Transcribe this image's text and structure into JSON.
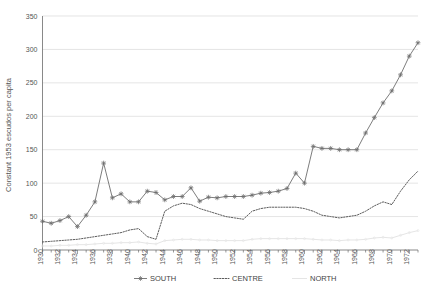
{
  "chart_data": {
    "type": "line",
    "title": "",
    "xlabel": "",
    "ylabel": "Constant 1953 escudos per capita",
    "xlim": [
      1930,
      1973
    ],
    "ylim": [
      0,
      350
    ],
    "ytick_step": 50,
    "xtick_step": 2,
    "grid": true,
    "legend_position": "bottom",
    "ytick_labels": [
      "0",
      "50",
      "100",
      "150",
      "200",
      "250",
      "300",
      "350"
    ],
    "yticks": [
      0,
      50,
      100,
      150,
      200,
      250,
      300,
      350
    ],
    "xtick_labels": [
      "1930",
      "1932",
      "1934",
      "1936",
      "1938",
      "1940",
      "1942",
      "1944",
      "1946",
      "1948",
      "1950",
      "1952",
      "1954",
      "1956",
      "1958",
      "1960",
      "1962",
      "1964",
      "1966",
      "1968",
      "1970",
      "1972"
    ],
    "xticks": [
      1930,
      1932,
      1934,
      1936,
      1938,
      1940,
      1942,
      1944,
      1946,
      1948,
      1950,
      1952,
      1954,
      1956,
      1958,
      1960,
      1962,
      1964,
      1966,
      1968,
      1970,
      1972
    ],
    "x": [
      1930,
      1931,
      1932,
      1933,
      1934,
      1935,
      1936,
      1937,
      1938,
      1939,
      1940,
      1941,
      1942,
      1943,
      1944,
      1945,
      1946,
      1947,
      1948,
      1949,
      1950,
      1951,
      1952,
      1953,
      1954,
      1955,
      1956,
      1957,
      1958,
      1959,
      1960,
      1961,
      1962,
      1963,
      1964,
      1965,
      1966,
      1967,
      1968,
      1969,
      1970,
      1971,
      1972,
      1973
    ],
    "series": [
      {
        "name": "SOUTH",
        "marker": "star",
        "linestyle": "solid",
        "color": "#6e6e6e",
        "values": [
          43,
          40,
          44,
          50,
          35,
          52,
          72,
          130,
          78,
          84,
          72,
          72,
          88,
          86,
          75,
          80,
          80,
          93,
          73,
          79,
          78,
          80,
          80,
          80,
          82,
          85,
          86,
          88,
          92,
          115,
          100,
          155,
          152,
          152,
          150,
          150,
          150,
          175,
          198,
          220,
          238,
          262,
          290,
          310
        ]
      },
      {
        "name": "CENTRE",
        "marker": "none",
        "linestyle": "dotted",
        "color": "#4a4a4a",
        "values": [
          12,
          13,
          14,
          15,
          16,
          18,
          20,
          22,
          24,
          26,
          30,
          32,
          20,
          16,
          58,
          66,
          70,
          68,
          62,
          58,
          54,
          50,
          48,
          46,
          58,
          62,
          64,
          64,
          64,
          64,
          62,
          58,
          52,
          50,
          48,
          50,
          52,
          58,
          66,
          72,
          68,
          88,
          105,
          118
        ]
      },
      {
        "name": "NORTH",
        "marker": "dot",
        "linestyle": "solid",
        "color": "#e2e2e2",
        "values": [
          6,
          6,
          7,
          7,
          8,
          8,
          9,
          10,
          10,
          11,
          11,
          12,
          10,
          9,
          14,
          15,
          16,
          16,
          15,
          15,
          14,
          14,
          14,
          14,
          16,
          17,
          17,
          17,
          17,
          17,
          17,
          16,
          15,
          15,
          14,
          15,
          15,
          16,
          18,
          19,
          18,
          22,
          26,
          29
        ]
      }
    ]
  },
  "legend": {
    "items": [
      {
        "label": "SOUTH",
        "marker": "star-line"
      },
      {
        "label": "CENTRE",
        "marker": "dotted-line"
      },
      {
        "label": "NORTH",
        "marker": "faint-line"
      }
    ]
  }
}
